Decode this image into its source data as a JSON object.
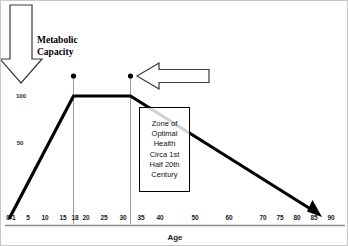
{
  "figure": {
    "axis_title": "Age",
    "annotation_metabolic": "Metabolic\nCapacity",
    "annotation_zone": "Zone of\nOptimal\nHealth\nCirca 1st\nHalf 20th\nCentury",
    "colors": {
      "curve": "#000000",
      "axis": "#8c8c8c",
      "guide_line": "#8f8f8f",
      "text": "#111111",
      "frame": "#c9c9c9"
    }
  },
  "chart_data": {
    "type": "line",
    "title": "",
    "subtitle": "",
    "xlabel": "Age",
    "ylabel": "Metabolic Capacity",
    "xlim": [
      0,
      90
    ],
    "ylim": [
      0,
      115
    ],
    "grid": false,
    "legend": "none",
    "x_tick_labels": [
      "0-1",
      "5",
      "10",
      "15",
      "18",
      "20",
      "25",
      "30",
      "35",
      "40",
      "50",
      "60",
      "70",
      "75",
      "80",
      "85",
      "90"
    ],
    "x_tick_values": [
      0.5,
      5,
      10,
      15,
      18,
      20,
      25,
      30,
      35,
      40,
      50,
      60,
      70,
      75,
      80,
      85,
      90
    ],
    "y_tick_labels": [
      "100",
      "50"
    ],
    "y_tick_values": [
      100,
      50
    ],
    "series": [
      {
        "name": "Metabolic Capacity",
        "x": [
          0.5,
          18,
          34,
          90
        ],
        "values": [
          0,
          100,
          100,
          0
        ],
        "arrow_end": true
      }
    ],
    "markers": [
      {
        "label": "plateau-start",
        "x": 18,
        "y": 113
      },
      {
        "label": "plateau-end",
        "x": 34,
        "y": 113
      }
    ],
    "guide_lines": [
      {
        "x": 18,
        "from_y": 113,
        "to_y": 0
      },
      {
        "x": 34,
        "from_y": 113,
        "to_y": 0
      }
    ],
    "annotations": [
      {
        "name": "metabolic-capacity",
        "text": "Metabolic Capacity",
        "arrow": "down"
      },
      {
        "name": "zone-callout",
        "text": "Zone of Optimal Health Circa 1st Half 20th Century",
        "arrow": "left"
      }
    ]
  }
}
